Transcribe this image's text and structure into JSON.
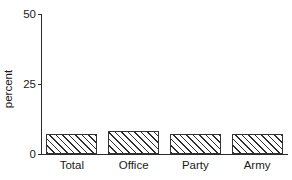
{
  "chart_data": {
    "type": "bar",
    "title": "",
    "subtitle": "",
    "xlabel": "",
    "ylabel": "percent",
    "categories": [
      "Total",
      "Office",
      "Party",
      "Army"
    ],
    "values": [
      7.3,
      8.2,
      7.0,
      7.0
    ],
    "ylim": [
      0,
      50
    ],
    "yticks": [
      0,
      25,
      50
    ],
    "ytick_labels": [
      "0",
      "25",
      "50"
    ],
    "grid": false,
    "legend": false,
    "legend_position": "none",
    "bar_fill": "hatched-diagonal",
    "bar_edge_color": "#333333",
    "axis_color": "#2b2b2b",
    "background_color": "#ffffff",
    "series": [
      {
        "name": "percent",
        "values": [
          7.3,
          8.2,
          7.0,
          7.0
        ]
      }
    ]
  },
  "axes": {
    "y_title": "percent",
    "y_ticks": [
      {
        "label": "50",
        "value": 50
      },
      {
        "label": "25",
        "value": 25
      },
      {
        "label": "0",
        "value": 0
      }
    ],
    "x_ticks": [
      {
        "label": "Total"
      },
      {
        "label": "Office"
      },
      {
        "label": "Party"
      },
      {
        "label": "Army"
      }
    ]
  }
}
